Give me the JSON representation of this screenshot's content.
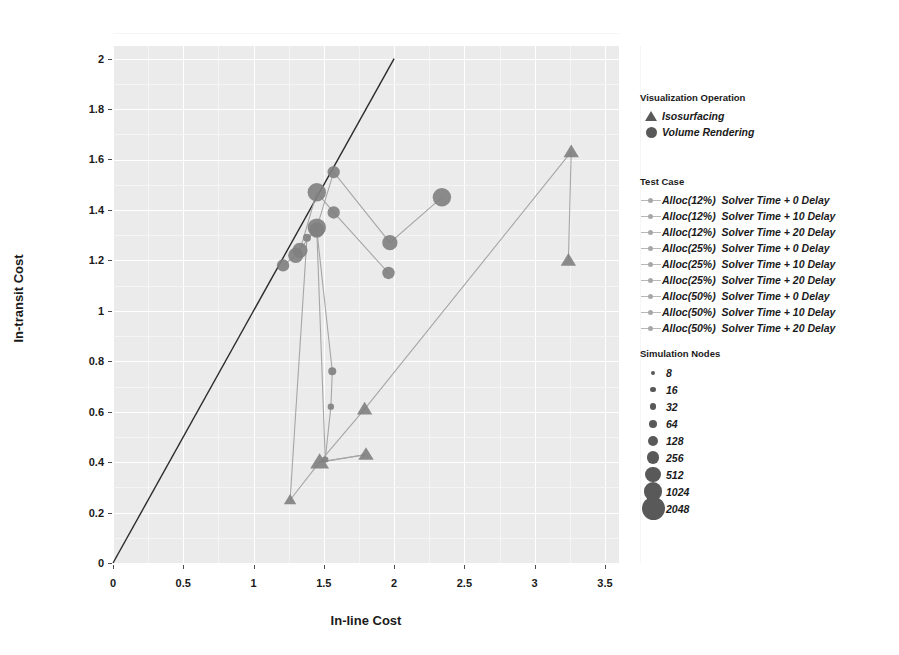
{
  "chart_data": {
    "type": "scatter",
    "title": "",
    "xlabel": "In-line Cost",
    "ylabel": "In-transit Cost",
    "xlim": [
      0,
      3.6
    ],
    "ylim": [
      0,
      2.05
    ],
    "xticks": [
      "0",
      "0.5",
      "1",
      "1.5",
      "2",
      "2.5",
      "3",
      "3.5"
    ],
    "xtick_values": [
      0,
      0.5,
      1,
      1.5,
      2,
      2.5,
      3,
      3.5
    ],
    "yticks": [
      "0",
      "0.2",
      "0.4",
      "0.6",
      "0.8",
      "1",
      "1.2",
      "1.4",
      "1.6",
      "1.8",
      "2"
    ],
    "ytick_values": [
      0,
      0.2,
      0.4,
      0.6,
      0.8,
      1.0,
      1.2,
      1.4,
      1.6,
      1.8,
      2.0
    ],
    "grid": true,
    "panel_background": "#ebebeb",
    "grid_color": "#ffffff",
    "marker_color": "#7f7f7f",
    "line_color": "#a6a6a6",
    "reference_line": {
      "label": "y = x",
      "from": [
        0,
        0
      ],
      "to": [
        2.0,
        2.0
      ],
      "color": "#2b2b2b"
    },
    "series": [
      {
        "name": "Volume Rendering - Alloc(12%) Solver Time + 0 Delay",
        "shape": "circle",
        "points": [
          {
            "x": 1.21,
            "y": 1.18,
            "nodes": 256
          },
          {
            "x": 1.3,
            "y": 1.22,
            "nodes": 512
          },
          {
            "x": 1.45,
            "y": 1.33,
            "nodes": 1024
          },
          {
            "x": 1.57,
            "y": 1.55,
            "nodes": 256
          },
          {
            "x": 1.97,
            "y": 1.27,
            "nodes": 512
          },
          {
            "x": 2.34,
            "y": 1.45,
            "nodes": 1024
          }
        ]
      },
      {
        "name": "Volume Rendering - Alloc(25%) Solver Time + 10 Delay",
        "shape": "circle",
        "points": [
          {
            "x": 1.33,
            "y": 1.24,
            "nodes": 512
          },
          {
            "x": 1.45,
            "y": 1.47,
            "nodes": 1024
          },
          {
            "x": 1.57,
            "y": 1.39,
            "nodes": 256
          },
          {
            "x": 1.96,
            "y": 1.15,
            "nodes": 256
          }
        ]
      },
      {
        "name": "Volume Rendering - Alloc(50%) Solver Time + 20 Delay",
        "shape": "circle",
        "points": [
          {
            "x": 1.38,
            "y": 1.29,
            "nodes": 64
          },
          {
            "x": 1.45,
            "y": 1.32,
            "nodes": 512
          },
          {
            "x": 1.56,
            "y": 0.76,
            "nodes": 64
          },
          {
            "x": 1.55,
            "y": 0.62,
            "nodes": 32
          },
          {
            "x": 1.51,
            "y": 0.41,
            "nodes": 32
          }
        ]
      },
      {
        "name": "Isosurfacing - Alloc(12%) Solver Time + 0 Delay",
        "shape": "triangle",
        "points": [
          {
            "x": 1.26,
            "y": 0.25,
            "nodes": 128
          },
          {
            "x": 1.47,
            "y": 0.4,
            "nodes": 512
          },
          {
            "x": 1.8,
            "y": 0.43,
            "nodes": 256
          }
        ]
      },
      {
        "name": "Isosurfacing - Alloc(50%) Solver Time + 20 Delay",
        "shape": "triangle",
        "points": [
          {
            "x": 1.79,
            "y": 0.61,
            "nodes": 256
          },
          {
            "x": 3.26,
            "y": 1.63,
            "nodes": 256
          },
          {
            "x": 3.24,
            "y": 1.2,
            "nodes": 256
          }
        ]
      }
    ]
  },
  "axes": {
    "xlabel": "In-line Cost",
    "ylabel": "In-transit Cost"
  },
  "legends": {
    "visualization_operation": {
      "title": "Visualization Operation",
      "items": [
        {
          "label": "Isosurfacing",
          "shape": "triangle"
        },
        {
          "label": "Volume Rendering",
          "shape": "circle"
        }
      ]
    },
    "test_case": {
      "title": "Test Case",
      "items": [
        {
          "label": "Alloc(12%)  Solver Time + 0 Delay"
        },
        {
          "label": "Alloc(12%)  Solver Time + 10 Delay"
        },
        {
          "label": "Alloc(12%)  Solver Time + 20 Delay"
        },
        {
          "label": "Alloc(25%)  Solver Time + 0 Delay"
        },
        {
          "label": "Alloc(25%)  Solver Time + 10 Delay"
        },
        {
          "label": "Alloc(25%)  Solver Time + 20 Delay"
        },
        {
          "label": "Alloc(50%)  Solver Time + 0 Delay"
        },
        {
          "label": "Alloc(50%)  Solver Time + 10 Delay"
        },
        {
          "label": "Alloc(50%)  Solver Time + 20 Delay"
        }
      ]
    },
    "simulation_nodes": {
      "title": "Simulation Nodes",
      "items": [
        {
          "label": "8",
          "size": 2.0
        },
        {
          "label": "16",
          "size": 2.6
        },
        {
          "label": "32",
          "size": 3.2
        },
        {
          "label": "64",
          "size": 4.0
        },
        {
          "label": "128",
          "size": 5.0
        },
        {
          "label": "256",
          "size": 6.2
        },
        {
          "label": "512",
          "size": 7.6
        },
        {
          "label": "1024",
          "size": 9.2
        },
        {
          "label": "2048",
          "size": 11.5
        }
      ]
    }
  }
}
